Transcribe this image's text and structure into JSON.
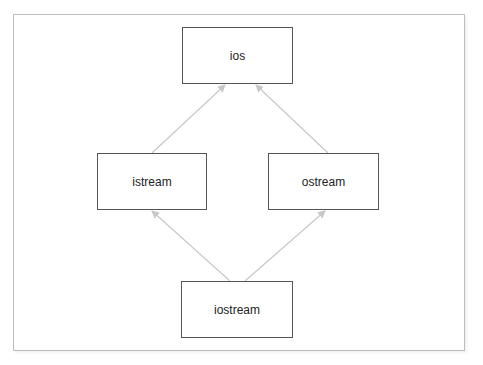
{
  "diagram": {
    "nodes": [
      {
        "id": "ios",
        "label": "ios"
      },
      {
        "id": "istream",
        "label": "istream"
      },
      {
        "id": "ostream",
        "label": "ostream"
      },
      {
        "id": "iostream",
        "label": "iostream"
      }
    ],
    "edges": [
      {
        "from": "istream",
        "to": "ios",
        "type": "inherits"
      },
      {
        "from": "ostream",
        "to": "ios",
        "type": "inherits"
      },
      {
        "from": "iostream",
        "to": "istream",
        "type": "inherits"
      },
      {
        "from": "iostream",
        "to": "ostream",
        "type": "inherits"
      }
    ],
    "colors": {
      "edge": "#c8c8c8",
      "node_border": "#555555",
      "frame_border": "#bdbdbd"
    }
  }
}
